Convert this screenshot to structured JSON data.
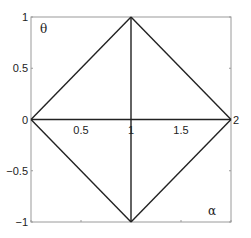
{
  "chart_data": {
    "type": "line",
    "title": "",
    "xlabel": "α",
    "ylabel": "θ",
    "xlim": [
      0,
      2
    ],
    "ylim": [
      -1,
      1
    ],
    "grid": false,
    "legend": null,
    "xticks": [
      0,
      0.5,
      1,
      1.5,
      2
    ],
    "xtick_labels": [
      "0",
      "0.5",
      "1",
      "1.5",
      "2"
    ],
    "yticks": [
      -1,
      -0.5,
      0,
      0.5,
      1
    ],
    "ytick_labels": [
      "−1",
      "−0.5",
      "0",
      "0.5",
      "1"
    ],
    "series": [
      {
        "name": "upper-left edge",
        "x": [
          0,
          1
        ],
        "y": [
          0,
          1
        ]
      },
      {
        "name": "upper-right edge",
        "x": [
          1,
          2
        ],
        "y": [
          1,
          0
        ]
      },
      {
        "name": "lower-right edge",
        "x": [
          2,
          1
        ],
        "y": [
          0,
          -1
        ]
      },
      {
        "name": "lower-left edge",
        "x": [
          1,
          0
        ],
        "y": [
          -1,
          0
        ]
      },
      {
        "name": "horizontal axis line",
        "x": [
          0,
          2
        ],
        "y": [
          0,
          0
        ]
      },
      {
        "name": "vertical center line",
        "x": [
          1,
          1
        ],
        "y": [
          -1,
          1
        ]
      }
    ],
    "annotations": [
      {
        "text": "θ",
        "position": "top-left inside axes"
      },
      {
        "text": "α",
        "position": "bottom-right inside axes"
      }
    ],
    "colors": {
      "line": "#222222",
      "axes": "#888888",
      "background": "#ffffff"
    }
  }
}
